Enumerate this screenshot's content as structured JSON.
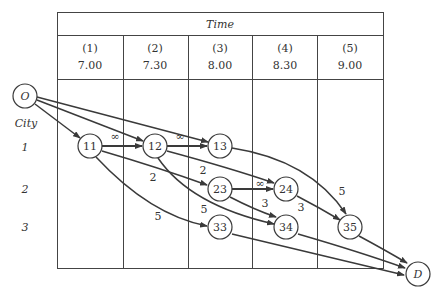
{
  "table": {
    "header": "Time",
    "columns": [
      {
        "index": "(1)",
        "time": "7.00"
      },
      {
        "index": "(2)",
        "time": "7.30"
      },
      {
        "index": "(3)",
        "time": "8.00"
      },
      {
        "index": "(4)",
        "time": "8.30"
      },
      {
        "index": "(5)",
        "time": "9.00"
      }
    ]
  },
  "rows": {
    "title": "City",
    "labels": [
      "1",
      "2",
      "3"
    ]
  },
  "nodes": {
    "origin": "O",
    "sink": "D",
    "n11": "11",
    "n12": "12",
    "n13": "13",
    "n23": "23",
    "n24": "24",
    "n33": "33",
    "n34": "34",
    "n35": "35"
  },
  "edges": [
    {
      "from": "O",
      "to": "11",
      "label": ""
    },
    {
      "from": "O",
      "to": "12",
      "label": ""
    },
    {
      "from": "O",
      "to": "13",
      "label": ""
    },
    {
      "from": "11",
      "to": "12",
      "label": "∞"
    },
    {
      "from": "12",
      "to": "13",
      "label": "∞"
    },
    {
      "from": "11",
      "to": "23",
      "label": "2"
    },
    {
      "from": "11",
      "to": "33",
      "label": "5"
    },
    {
      "from": "12",
      "to": "24",
      "label": "2"
    },
    {
      "from": "12",
      "to": "34",
      "label": "5"
    },
    {
      "from": "23",
      "to": "24",
      "label": "∞"
    },
    {
      "from": "23",
      "to": "34",
      "label": "3"
    },
    {
      "from": "24",
      "to": "35",
      "label": "3"
    },
    {
      "from": "13",
      "to": "35",
      "label": "5"
    },
    {
      "from": "33",
      "to": "D",
      "label": ""
    },
    {
      "from": "34",
      "to": "D",
      "label": ""
    },
    {
      "from": "35",
      "to": "D",
      "label": ""
    }
  ],
  "edge_labels": {
    "inf_11_12": "∞",
    "inf_12_13": "∞",
    "w_11_23": "2",
    "w_12_24": "2",
    "w_11_33": "5",
    "w_12_34": "5",
    "inf_23_24": "∞",
    "w_23_34": "3",
    "w_24_35": "3",
    "w_13_35": "5"
  },
  "colors": {
    "line": "#3a3a3a",
    "text": "#333333",
    "background": "#ffffff"
  }
}
